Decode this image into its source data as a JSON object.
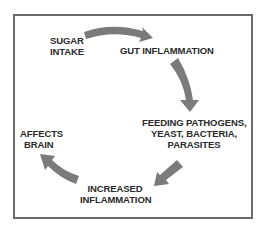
{
  "diagram": {
    "type": "cycle",
    "nodes": [
      {
        "id": "sugar",
        "label_line1": "SUGAR",
        "label_line2": "INTAKE"
      },
      {
        "id": "gut",
        "label_line1": "GUT INFLAMMATION"
      },
      {
        "id": "feeding",
        "label_line1": "FEEDING PATHOGENS,",
        "label_line2": "YEAST, BACTERIA,",
        "label_line3": "PARASITES"
      },
      {
        "id": "increased",
        "label_line1": "INCREASED",
        "label_line2": "INFLAMMATION"
      },
      {
        "id": "brain",
        "label_line1": "AFFECTS",
        "label_line2": "BRAIN"
      }
    ],
    "edges": [
      {
        "from": "sugar",
        "to": "gut"
      },
      {
        "from": "gut",
        "to": "feeding"
      },
      {
        "from": "feeding",
        "to": "increased"
      },
      {
        "from": "increased",
        "to": "brain"
      }
    ],
    "colors": {
      "arrow": "#7b7b7b",
      "text": "#2a2a2a",
      "frame": "#6a6a6a",
      "background": "#ffffff"
    }
  }
}
